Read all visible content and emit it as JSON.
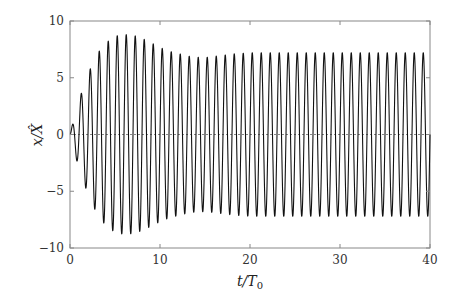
{
  "chart_data": {
    "type": "line",
    "title": "",
    "xlabel": "t/T0",
    "ylabel": "x/X̂",
    "xlim": [
      0,
      40
    ],
    "ylim": [
      -10,
      10
    ],
    "xticks": [
      0,
      10,
      20,
      30,
      40
    ],
    "yticks": [
      -10,
      -5,
      0,
      5,
      10
    ],
    "xtick_labels": [
      "0",
      "10",
      "20",
      "30",
      "40"
    ],
    "ytick_labels": [
      "−10",
      "−5",
      "0",
      "5",
      "10"
    ],
    "grid": false,
    "legend": null,
    "reference_line": {
      "y": 0,
      "style": "dashed"
    },
    "series": [
      {
        "name": "x/X̂ response",
        "color": "#111111",
        "description": "Oscillation with period ≈ 1 T0; envelope grows from 0 to peak ≈ 8.8 near t≈6, decays to ≈ 6.8 near t≈14-15, then settles at ≈ 7.2",
        "period": 1.0,
        "envelope": {
          "t": [
            0,
            0.25,
            0.75,
            1.2,
            2.2,
            3.2,
            4.2,
            5.2,
            6.2,
            7.2,
            8.2,
            9.2,
            10.2,
            11.2,
            12.2,
            13.2,
            14.2,
            15.2,
            16.2,
            17.2,
            18.2,
            20,
            25,
            30,
            35,
            40
          ],
          "amplitude": [
            0,
            0.8,
            2.3,
            3.5,
            5.7,
            7.3,
            8.2,
            8.7,
            8.8,
            8.7,
            8.4,
            8.0,
            7.6,
            7.3,
            7.1,
            6.9,
            6.8,
            6.8,
            6.9,
            7.0,
            7.1,
            7.2,
            7.2,
            7.2,
            7.2,
            7.2
          ]
        }
      }
    ]
  },
  "axes": {
    "x_label_main": "t/T",
    "x_label_sub": "0",
    "y_label": "x/X̂"
  }
}
